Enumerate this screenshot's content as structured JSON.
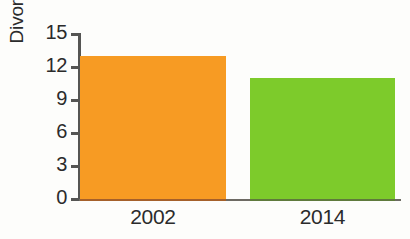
{
  "chart_data": {
    "type": "bar",
    "title": "",
    "xlabel": "",
    "ylabel": "Divorces per 1000",
    "categories": [
      "2002",
      "2014"
    ],
    "values": [
      13.0,
      11.0
    ],
    "ylim": [
      0,
      15
    ],
    "yticks": [
      0,
      3,
      6,
      9,
      12,
      15
    ],
    "ytick_labels": [
      "0",
      "3",
      "6",
      "9",
      "12",
      "15"
    ],
    "grid": false,
    "legend": false,
    "bar_colors": [
      "#f79b23",
      "#7dcb2b"
    ],
    "axis_color": "#555553",
    "text_color": "#2b2b2b",
    "background": "#fdfdfb"
  }
}
